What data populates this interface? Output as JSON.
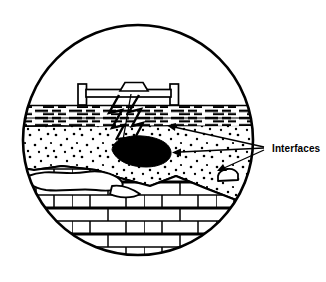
{
  "figure": {
    "type": "pavement-cross-section-diagram",
    "title": "",
    "background_color": "#ffffff",
    "line_color": "#000000",
    "width": 326,
    "height": 282
  },
  "circle_frame": {
    "name": "circular-viewport",
    "center_x": 138,
    "center_y": 140,
    "radius": 116,
    "stroke_width": 2.6,
    "stroke_color": "#000000",
    "fill_color": "#ffffff"
  },
  "layers": [
    {
      "id": "air-void-space",
      "label": "air / open space",
      "order": 1,
      "fill_color": "#ffffff",
      "pattern": "none",
      "top_y": 24,
      "bottom_y": 105
    },
    {
      "id": "asphalt-layer",
      "label": "asphalt surface course",
      "order": 2,
      "fill_color": "#ffffff",
      "pattern": "horizontal-dashes",
      "top_y": 105,
      "bottom_y": 127,
      "dash_rows": 6,
      "dash_color": "#000000"
    },
    {
      "id": "granular-base-layer",
      "label": "granular base / sand",
      "order": 3,
      "fill_color": "#ffffff",
      "pattern": "scattered-dots",
      "top_y": 127,
      "bottom_y": 200,
      "dot_color": "#000000"
    },
    {
      "id": "masonry-subbase-layer",
      "label": "masonry / brick subbase",
      "order": 4,
      "fill_color": "#ffffff",
      "pattern": "running-bond-brick",
      "top_y": 168,
      "bottom_y": 256,
      "brick_row_height": 13,
      "brick_width": 36,
      "mortar_color": "#000000"
    }
  ],
  "surface_apparatus": {
    "name": "surface-equipment",
    "description": "horizontal beam on two posts with central trapezoid block",
    "beam": {
      "x": 88,
      "y": 89,
      "width": 80,
      "height": 8
    },
    "left_post": {
      "x": 78,
      "y": 84,
      "width": 8,
      "height": 21
    },
    "right_post": {
      "x": 170,
      "y": 84,
      "width": 8,
      "height": 21
    },
    "center_block": {
      "x": 120,
      "y": 82,
      "width": 28,
      "height": 9,
      "shape": "trapezoid"
    }
  },
  "defect": {
    "name": "subsurface-void",
    "label": "buried void / anomaly",
    "fill_color": "#000000",
    "center_x": 140,
    "center_y": 152,
    "approx_width": 60,
    "approx_height": 28
  },
  "signal_paths": {
    "name": "signal-zigzag-rays",
    "count": 2,
    "description": "lightning-bolt style ray paths from apparatus into subsurface",
    "color": "#000000"
  },
  "annotations": [
    {
      "id": "interfaces-label",
      "text": "Interfaces",
      "x": 272,
      "y": 151,
      "font_size": 10,
      "font_weight": "bold",
      "color": "#000000",
      "arrow_origin_x": 264,
      "arrow_origin_y": 148,
      "arrow_count": 3,
      "arrow_targets": [
        {
          "id": "asphalt-base-interface",
          "x": 167,
          "y": 128
        },
        {
          "id": "void-interface",
          "x": 172,
          "y": 152
        },
        {
          "id": "base-masonry-interface",
          "x": 216,
          "y": 170
        }
      ]
    }
  ],
  "pointer_arrows": [
    {
      "id": "apparatus-to-void-arrow",
      "from_x": 130,
      "from_y": 94,
      "to_x": 132,
      "to_y": 144,
      "color": "#000000"
    }
  ]
}
